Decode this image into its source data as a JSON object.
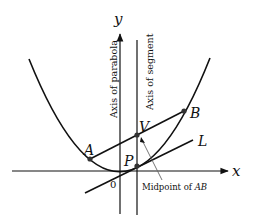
{
  "diagram": {
    "axes": {
      "x_label": "x",
      "y_label": "y",
      "origin_label": "0"
    },
    "vertical_labels": {
      "parabola_axis": "Axis of parabola",
      "segment_axis": "Axis of segment"
    },
    "points": {
      "A": "A",
      "B": "B",
      "V": "V",
      "P": "P"
    },
    "line_label": "L",
    "annotation": {
      "prefix": "Midpoint of ",
      "segment": "AB"
    },
    "colors": {
      "stroke": "#111111",
      "point_fill": "#333333",
      "pointer": "#666666"
    }
  }
}
